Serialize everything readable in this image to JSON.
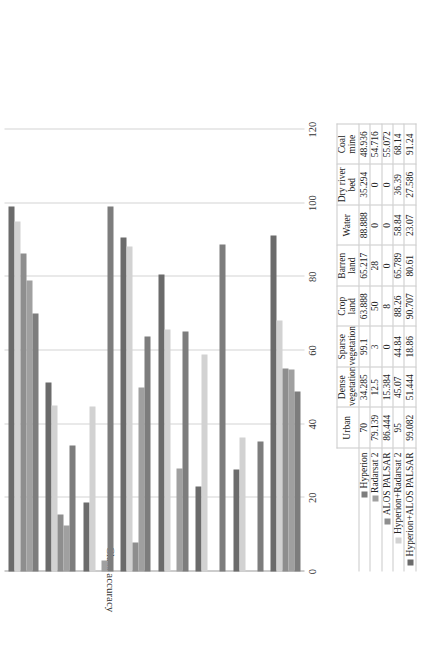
{
  "chart_data": {
    "type": "bar",
    "orientation": "horizontal",
    "title": "",
    "xlabel": "",
    "ylabel": "Class accuracy",
    "axis_title": "Class accuracy",
    "ylim": [
      0,
      120
    ],
    "value_ticks": [
      "0",
      "20",
      "40",
      "60",
      "80",
      "100",
      "120"
    ],
    "value_tick_numbers": [
      0,
      20,
      40,
      60,
      80,
      100,
      120
    ],
    "grid": true,
    "legend_position": "bottom",
    "categories": [
      "Urban",
      "Dense vegetation",
      "Sparse vegetation",
      "Crop land",
      "Barren land",
      "Water",
      "Dry river bed",
      "Coal mine"
    ],
    "series": [
      {
        "name": "Hyperion",
        "color": "#7d7d7d",
        "values": [
          70,
          34.285,
          99.1,
          63.888,
          65.217,
          88.888,
          35.294,
          48.936
        ],
        "labels": [
          "70",
          "34.285",
          "99.1",
          "63.888",
          "65.217",
          "88.888",
          "35.294",
          "48.936"
        ]
      },
      {
        "name": "Radarsat 2",
        "color": "#a0a0a0",
        "values": [
          79.139,
          12.5,
          3,
          50,
          28,
          0,
          0,
          54.716
        ],
        "labels": [
          "79.139",
          "12.5",
          "3",
          "50",
          "28",
          "0",
          "0",
          "54.716"
        ]
      },
      {
        "name": "ALOS PALSAR",
        "color": "#8e8e8e",
        "values": [
          86.444,
          15.384,
          0,
          8,
          0,
          0,
          0,
          55.072
        ],
        "labels": [
          "86.444",
          "15.384",
          "0",
          "8",
          "0",
          "0",
          "0",
          "55.072"
        ]
      },
      {
        "name": "Hyperion+Radarsat 2",
        "color": "#d2d2d2",
        "values": [
          95,
          45.07,
          44.84,
          88.26,
          65.789,
          58.84,
          36.39,
          68.14
        ],
        "labels": [
          "95",
          "45.07",
          "44.84",
          "88.26",
          "65.789",
          "58.84",
          "36.39",
          "68.14"
        ]
      },
      {
        "name": "Hyperion+ALOS PALSAR",
        "color": "#6b6b6b",
        "values": [
          99.082,
          51.444,
          18.86,
          90.707,
          80.61,
          23.07,
          27.586,
          91.24
        ],
        "labels": [
          "99.082",
          "51.444",
          "18.86",
          "90.707",
          "80.61",
          "23.07",
          "27.586",
          "91.24"
        ]
      }
    ]
  }
}
